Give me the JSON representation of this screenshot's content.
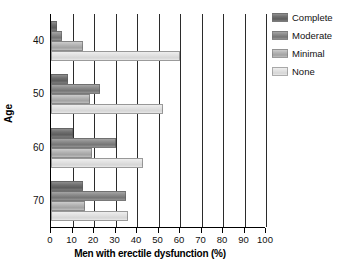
{
  "chart_data": {
    "type": "bar",
    "orientation": "horizontal",
    "title": "",
    "xlabel": "Men with erectile dysfunction (%)",
    "ylabel": "Age",
    "categories": [
      "40",
      "50",
      "60",
      "70"
    ],
    "xlim": [
      0,
      100
    ],
    "xticks": [
      0,
      10,
      20,
      30,
      40,
      50,
      60,
      70,
      80,
      90,
      100
    ],
    "xticklabels": [
      "0",
      "10",
      "20",
      "30",
      "40",
      "50",
      "60",
      "70",
      "80",
      "90",
      "100"
    ],
    "grid": "vertical",
    "legend_position": "right",
    "series": [
      {
        "name": "Complete",
        "color": "#6f6f6f",
        "values": [
          3,
          8,
          10,
          15
        ]
      },
      {
        "name": "Moderate",
        "color": "#8a8a8a",
        "values": [
          5,
          23,
          30,
          35
        ]
      },
      {
        "name": "Minimal",
        "color": "#b4b4b4",
        "values": [
          15,
          18,
          19,
          16
        ]
      },
      {
        "name": "None",
        "color": "#e1e1e1",
        "values": [
          60,
          52,
          43,
          36
        ]
      }
    ]
  },
  "axes": {
    "y_title": "Age",
    "x_title": "Men with erectile dysfunction (%)",
    "y_labels": [
      "40",
      "50",
      "60",
      "70"
    ],
    "x_labels": [
      "0",
      "10",
      "20",
      "30",
      "40",
      "50",
      "60",
      "70",
      "80",
      "90",
      "100"
    ]
  },
  "legend": {
    "items": [
      {
        "label": "Complete"
      },
      {
        "label": "Moderate"
      },
      {
        "label": "Minimal"
      },
      {
        "label": "None"
      }
    ]
  }
}
